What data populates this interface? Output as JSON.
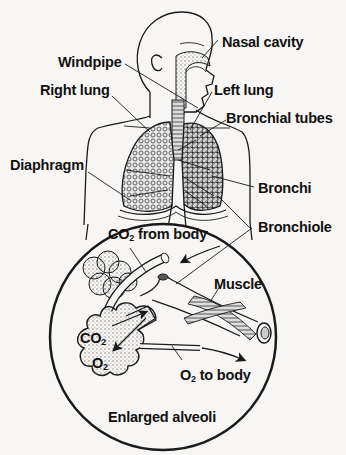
{
  "diagram": {
    "labels": {
      "nasal_cavity": "Nasal cavity",
      "windpipe": "Windpipe",
      "left_lung": "Left lung",
      "right_lung": "Right lung",
      "bronchial_tubes": "Bronchial tubes",
      "diaphragm": "Diaphragm",
      "bronchi": "Bronchi",
      "bronchiole": "Bronchiole",
      "co2_from_body_prefix": "CO",
      "co2_from_body_sub": "2",
      "co2_from_body_suffix": " from body",
      "muscle": "Muscle",
      "co2_prefix": "CO",
      "co2_sub": "2",
      "o2_prefix": "O",
      "o2_sub": "2",
      "o2_to_body_prefix": "O",
      "o2_to_body_sub": "2",
      "o2_to_body_suffix": " to body",
      "enlarged_alveoli": "Enlarged alveoli"
    },
    "colors": {
      "ink": "#1a1a1a",
      "paper": "#f7f6f4",
      "stipple": "#8a8a8a"
    }
  }
}
